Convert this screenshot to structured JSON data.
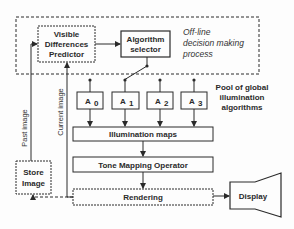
{
  "diagram": {
    "offline_region": {
      "label_lines": [
        "Off-line",
        "decision making",
        "process"
      ]
    },
    "nodes": {
      "vdp": {
        "lines": [
          "Visible",
          "Differences",
          "Predictor"
        ]
      },
      "selector": {
        "lines": [
          "Algorithm",
          "selector"
        ]
      },
      "algorithms": [
        {
          "label": "A",
          "sub": "0"
        },
        {
          "label": "A",
          "sub": "1"
        },
        {
          "label": "A",
          "sub": "2"
        },
        {
          "label": "A",
          "sub": "3"
        }
      ],
      "pool_label": [
        "Pool of global",
        "illumination",
        "algorithms"
      ],
      "illumination_maps": "Illumination maps",
      "tone_mapping": "Tone Mapping Operator",
      "rendering": "Rendering",
      "store_image": [
        "Store",
        "Image"
      ],
      "display": "Display"
    },
    "edge_labels": {
      "past_image": "Past image",
      "current_image": "Current image"
    },
    "colors": {
      "stroke": "#2a2a2a",
      "background": "#fdfdfd"
    }
  }
}
